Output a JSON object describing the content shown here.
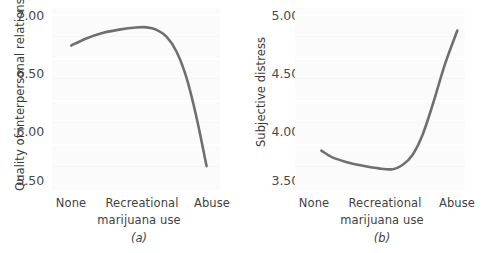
{
  "figure": {
    "background_color": "#ffffff",
    "plot_background_color": "#fbfbfb",
    "curve_color": "#6f6f6f",
    "text_color": "#3f3f3f"
  },
  "chart_data": [
    {
      "type": "line",
      "panel_id": "a",
      "subcaption": "(a)",
      "title": "",
      "xlabel": "Recreational marijuana use",
      "ylabel": "Quality of interpersonal relations",
      "categories": [
        "None",
        "Recreational",
        "Abuse"
      ],
      "xticklabels": [
        "None",
        "Recreational",
        "Abuse"
      ],
      "yticklabels": [
        "7.00",
        "6.50",
        "6.00",
        "5.50"
      ],
      "yticks": [
        7.0,
        6.5,
        6.0,
        5.5
      ],
      "ylim": [
        5.45,
        7.05
      ],
      "xlim": [
        0,
        1
      ],
      "grid": "faint-horizontal",
      "legend": "none",
      "series": [
        {
          "name": "Quality of interpersonal relations",
          "x": [
            0.115,
            0.2,
            0.3,
            0.4,
            0.5,
            0.565,
            0.62,
            0.68,
            0.74,
            0.8,
            0.86,
            0.92
          ],
          "values": [
            6.72,
            6.78,
            6.83,
            6.86,
            6.879,
            6.88,
            6.86,
            6.8,
            6.67,
            6.44,
            6.09,
            5.66
          ]
        }
      ]
    },
    {
      "type": "line",
      "panel_id": "b",
      "subcaption": "(b)",
      "title": "",
      "xlabel": "Recreational marijuana use",
      "ylabel": "Subjective distress",
      "categories": [
        "None",
        "Recreational",
        "Abuse"
      ],
      "xticklabels": [
        "None",
        "Recreational",
        "Abuse"
      ],
      "yticklabels": [
        "5.00",
        "4.50",
        "4.00",
        "3.50"
      ],
      "yticks": [
        5.0,
        4.5,
        4.0,
        3.5
      ],
      "ylim": [
        3.44,
        5.06
      ],
      "xlim": [
        0,
        1
      ],
      "grid": "faint-horizontal",
      "legend": "none",
      "series": [
        {
          "name": "Subjective distress",
          "x": [
            0.155,
            0.22,
            0.3,
            0.4,
            0.5,
            0.575,
            0.63,
            0.69,
            0.75,
            0.81,
            0.88,
            0.955
          ],
          "values": [
            3.79,
            3.73,
            3.69,
            3.655,
            3.63,
            3.625,
            3.66,
            3.75,
            3.93,
            4.2,
            4.55,
            4.86
          ]
        }
      ]
    }
  ]
}
